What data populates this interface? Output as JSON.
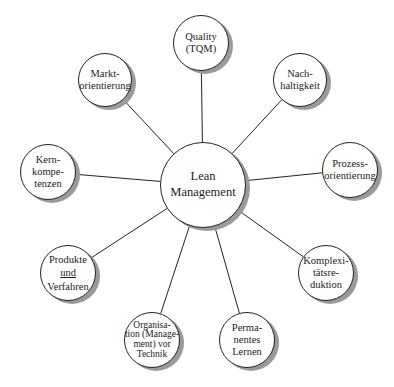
{
  "center": {
    "lines": [
      "Lean",
      "Management"
    ],
    "cx": 203,
    "cy": 185,
    "r": 43
  },
  "nodes": [
    {
      "id": "quality",
      "lines": [
        "Quality",
        "(TQM)"
      ],
      "cx": 201,
      "cy": 43,
      "r": 28
    },
    {
      "id": "nachhaltigkeit",
      "lines": [
        "Nach-",
        "haltigkeit"
      ],
      "cx": 300,
      "cy": 80,
      "r": 27
    },
    {
      "id": "prozessorientierung",
      "lines": [
        "Prozess-",
        "orientierung"
      ],
      "cx": 350,
      "cy": 170,
      "r": 28
    },
    {
      "id": "komplexitaetsreduktion",
      "lines": [
        "Komplexi-",
        "tätsre-",
        "duktion"
      ],
      "cx": 326,
      "cy": 273,
      "r": 28
    },
    {
      "id": "permanentes-lernen",
      "lines": [
        "Perma-",
        "nentes",
        "Lernen"
      ],
      "cx": 247,
      "cy": 340,
      "r": 28
    },
    {
      "id": "organisation-vor-technik",
      "lines": [
        "Organisa-",
        "tion (Manage-",
        "ment) vor",
        "Technik"
      ],
      "cx": 152,
      "cy": 340,
      "r": 28
    },
    {
      "id": "produkte-und-verfahren",
      "lines": [
        "Produkte",
        "und",
        "Verfahren"
      ],
      "cx": 68,
      "cy": 273,
      "r": 28,
      "underline_line": 1
    },
    {
      "id": "kernkompetenzen",
      "lines": [
        "Kern-",
        "kompe-",
        "tenzen"
      ],
      "cx": 48,
      "cy": 172,
      "r": 28
    },
    {
      "id": "marktorientierung",
      "lines": [
        "Markt-",
        "orientierung"
      ],
      "cx": 105,
      "cy": 80,
      "r": 27
    }
  ],
  "colors": {
    "line": "#222222",
    "shadow": "#9a9a9a",
    "fill": "#ffffff"
  }
}
